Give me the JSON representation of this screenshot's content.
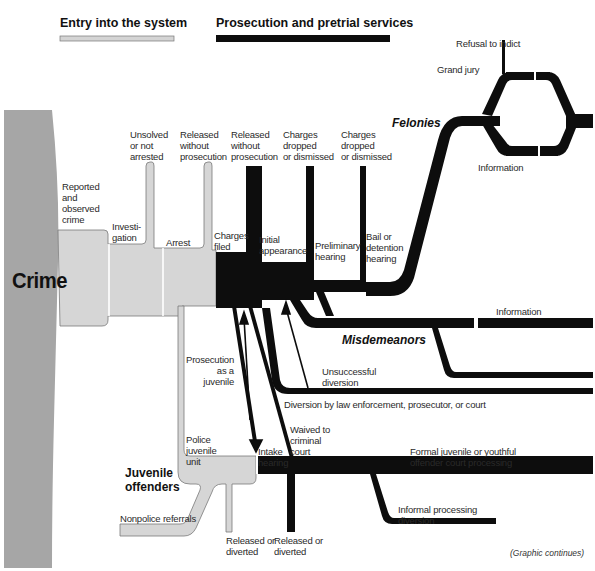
{
  "legend": {
    "entry": {
      "label": "Entry into the system",
      "color": "#d4d4d4"
    },
    "prosecution": {
      "label": "Prosecution and pretrial services",
      "color": "#0d0d0d"
    }
  },
  "colors": {
    "crime_band": "#a6a6a6",
    "entry_flow": "#d6d6d6",
    "prosecution_flow": "#0d0d0d",
    "outline": "#777777"
  },
  "crime": {
    "label": "Crime"
  },
  "stages": {
    "reported": "Reported\nand\nobserved\ncrime",
    "investigation": "Investi-\ngation",
    "arrest": "Arrest",
    "charges_filed": "Charges\nfiled",
    "initial_appearance": "Initial\nappearance",
    "preliminary_hearing": "Preliminary\nhearing",
    "bail_hearing": "Bail or\ndetention\nhearing"
  },
  "exits": {
    "unsolved": "Unsolved\nor not\narrested",
    "released_1": "Released\nwithout\nprosecution",
    "released_2": "Released\nwithout\nprosecution",
    "dropped_1": "Charges\ndropped\nor dismissed",
    "dropped_2": "Charges\ndropped\nor dismissed"
  },
  "felonies": {
    "label": "Felonies",
    "refusal": "Refusal to indict",
    "grand_jury": "Grand jury",
    "information": "Information"
  },
  "misdemeanors": {
    "label": "Misdemeanors",
    "information": "Information",
    "unsuccessful_diversion": "Unsuccessful\ndiversion",
    "diversion": "Diversion by law enforcement, prosecutor, or court"
  },
  "juvenile": {
    "label": "Juvenile\noffenders",
    "prosecution_as_juvenile": "Prosecution\nas a\njuvenile",
    "police_unit": "Police\njuvenile\nunit",
    "intake_hearing": "Intake\nhearing",
    "waived": "Waived to\ncriminal\ncourt",
    "formal": "Formal juvenile or youthful\noffender court processing",
    "informal": "Informal processing\ndiversion",
    "nonpolice": "Nonpolice referrals",
    "released_1": "Released or\ndiverted",
    "released_2": "Released or\ndiverted"
  },
  "footer": {
    "note": "(Graphic continues)"
  }
}
